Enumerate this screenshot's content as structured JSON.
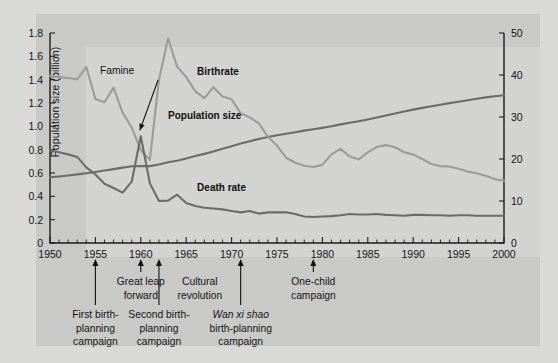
{
  "chart_data": {
    "type": "line",
    "title": "",
    "xlabel": "",
    "ylabel_left": "Population size (billion)",
    "ylabel_right": "Births/deaths per 1000 population",
    "xlim": [
      1950,
      2000
    ],
    "ylim_left": [
      0,
      1.8
    ],
    "ylim_right": [
      0,
      50
    ],
    "xticks": [
      1950,
      1955,
      1960,
      1965,
      1970,
      1975,
      1980,
      1985,
      1990,
      1995,
      2000
    ],
    "yticks_left": [
      "0",
      "0.2",
      "0.4",
      "0.6",
      "0.8",
      "1.0",
      "1.2",
      "1.4",
      "1.6",
      "1.8"
    ],
    "yticks_right": [
      "0",
      "10",
      "20",
      "30",
      "40",
      "50"
    ],
    "minor_tick_interval": 1,
    "grid": false,
    "legend_position": "inline-labels",
    "series": [
      {
        "name": "Population size",
        "axis": "left",
        "color": "#6b6b6b",
        "label_x": 1963.0,
        "label_y": 1.06,
        "x": [
          1950,
          1951,
          1952,
          1953,
          1954,
          1955,
          1956,
          1957,
          1958,
          1959,
          1960,
          1961,
          1962,
          1963,
          1964,
          1965,
          1966,
          1967,
          1968,
          1969,
          1970,
          1971,
          1972,
          1973,
          1974,
          1975,
          1976,
          1977,
          1978,
          1979,
          1980,
          1981,
          1982,
          1983,
          1984,
          1985,
          1986,
          1987,
          1988,
          1989,
          1990,
          1991,
          1992,
          1993,
          1994,
          1995,
          1996,
          1997,
          1998,
          1999,
          2000
        ],
        "values": [
          0.563,
          0.57,
          0.578,
          0.588,
          0.598,
          0.609,
          0.621,
          0.633,
          0.646,
          0.658,
          0.66,
          0.659,
          0.673,
          0.692,
          0.705,
          0.725,
          0.745,
          0.764,
          0.785,
          0.807,
          0.83,
          0.852,
          0.872,
          0.892,
          0.909,
          0.924,
          0.937,
          0.95,
          0.963,
          0.975,
          0.987,
          1.0,
          1.017,
          1.03,
          1.044,
          1.059,
          1.075,
          1.093,
          1.11,
          1.127,
          1.143,
          1.158,
          1.172,
          1.185,
          1.199,
          1.211,
          1.224,
          1.236,
          1.248,
          1.258,
          1.267
        ]
      },
      {
        "name": "Birthrate",
        "axis": "right",
        "color": "#9b9b9b",
        "label_x": 1966.2,
        "label_y_right": 40.0,
        "x": [
          1950,
          1951,
          1952,
          1953,
          1954,
          1955,
          1956,
          1957,
          1958,
          1959,
          1960,
          1961,
          1962,
          1963,
          1964,
          1965,
          1966,
          1967,
          1968,
          1969,
          1970,
          1971,
          1972,
          1973,
          1974,
          1975,
          1976,
          1977,
          1978,
          1979,
          1980,
          1981,
          1982,
          1983,
          1984,
          1985,
          1986,
          1987,
          1988,
          1989,
          1990,
          1991,
          1992,
          1993,
          1994,
          1995,
          1996,
          1997,
          1998,
          1999,
          2000
        ],
        "values": [
          39.8,
          39.5,
          39.3,
          39.0,
          41.9,
          34.3,
          33.5,
          37.0,
          31.0,
          27.5,
          22.1,
          19.8,
          38.9,
          48.7,
          42.0,
          39.5,
          36.1,
          34.5,
          37.1,
          34.9,
          34.2,
          30.9,
          29.9,
          28.5,
          25.3,
          23.2,
          20.3,
          19.1,
          18.4,
          18.1,
          18.6,
          21.1,
          22.4,
          20.6,
          19.9,
          21.6,
          22.9,
          23.3,
          22.8,
          21.6,
          21.1,
          20.0,
          18.8,
          18.3,
          18.2,
          17.7,
          17.0,
          16.6,
          16.0,
          15.2,
          14.8
        ]
      },
      {
        "name": "Death rate",
        "axis": "right",
        "color": "#6b6b6b",
        "label_x": 1966.2,
        "label_y_right": 12.5,
        "x": [
          1950,
          1951,
          1952,
          1953,
          1954,
          1955,
          1956,
          1957,
          1958,
          1959,
          1960,
          1961,
          1962,
          1963,
          1964,
          1965,
          1966,
          1967,
          1968,
          1969,
          1970,
          1971,
          1972,
          1973,
          1974,
          1975,
          1976,
          1977,
          1978,
          1979,
          1980,
          1981,
          1982,
          1983,
          1984,
          1985,
          1986,
          1987,
          1988,
          1989,
          1990,
          1991,
          1992,
          1993,
          1994,
          1995,
          1996,
          1997,
          1998,
          1999,
          2000
        ],
        "values": [
          22.1,
          21.6,
          21.1,
          20.5,
          18.0,
          16.3,
          14.1,
          13.1,
          12.0,
          14.6,
          25.4,
          14.2,
          10.0,
          10.1,
          11.5,
          9.5,
          8.8,
          8.4,
          8.2,
          8.0,
          7.6,
          7.3,
          7.6,
          7.0,
          7.3,
          7.3,
          7.3,
          6.9,
          6.3,
          6.2,
          6.3,
          6.4,
          6.6,
          6.9,
          6.8,
          6.8,
          6.9,
          6.7,
          6.6,
          6.5,
          6.7,
          6.7,
          6.6,
          6.6,
          6.5,
          6.6,
          6.6,
          6.5,
          6.5,
          6.5,
          6.5
        ]
      }
    ],
    "annotations": [
      {
        "id": "famine",
        "label": "Famine",
        "text_x": 1955.5,
        "text_y_px": 60,
        "arrow_from_x": 1958.6,
        "arrow_to_year": 1960.0,
        "arrow_to_value_right": 25.4
      },
      {
        "id": "great-leap-forward",
        "lines": [
          "Great leap",
          "forward"
        ],
        "year": 1960.0,
        "tier": 1
      },
      {
        "id": "cultural-revolution",
        "lines": [
          "Cultural",
          "revolution"
        ],
        "year": 1966.5,
        "tier": 1,
        "no_arrow": true
      },
      {
        "id": "one-child-campaign",
        "lines": [
          "One-child",
          "campaign"
        ],
        "year": 1979.0,
        "tier": 1
      },
      {
        "id": "first-birth-planning-campaign",
        "lines": [
          "First birth-",
          "planning",
          "campaign"
        ],
        "year": 1955.0,
        "tier": 2
      },
      {
        "id": "second-birth-planning-campaign",
        "lines": [
          "Second birth-",
          "planning",
          "campaign"
        ],
        "year": 1962.0,
        "tier": 2
      },
      {
        "id": "wan-xi-shao-birth-planning-campaign",
        "lines": [
          "Wan xi shao",
          "birth-planning",
          "campaign"
        ],
        "italic_first_line": true,
        "year": 1971.0,
        "tier": 2
      }
    ]
  },
  "colors": {
    "figure_background": "#d9d9d7",
    "panel_background": "#c9c9c7",
    "plot_background": "#d3d3d1",
    "axis": "#1c1c1c",
    "text": "#141414",
    "population_line": "#6b6b6b",
    "birthrate_line": "#9b9b9b",
    "deathrate_line": "#6b6b6b"
  }
}
